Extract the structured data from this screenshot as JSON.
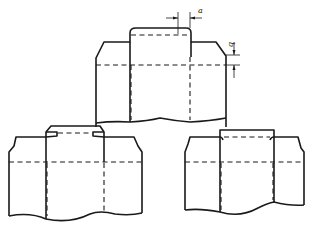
{
  "figure": {
    "dimensions": {
      "a_label": "a",
      "b_label": "b"
    },
    "views": [
      {
        "id": "top",
        "name": "key-with-rounded-top",
        "position": "top-center"
      },
      {
        "id": "bottom-left",
        "name": "key-with-chamfered-top",
        "position": "bottom-left"
      },
      {
        "id": "bottom-right",
        "name": "key-flush-square",
        "position": "bottom-right"
      }
    ],
    "colors": {
      "line": "#1a1a1a",
      "background": "#ffffff"
    }
  }
}
